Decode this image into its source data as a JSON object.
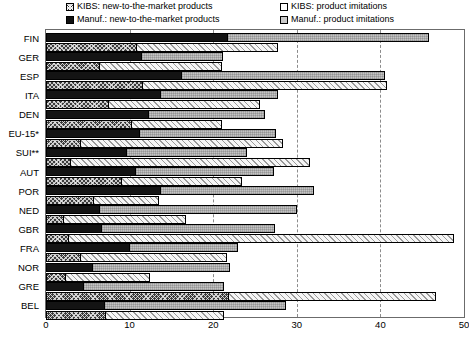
{
  "legend": {
    "items": [
      {
        "key": "kibs_new",
        "label": "KIBS: new-to-the-market products",
        "swatch": "kibs-new-swatch-icon",
        "color": "#3a3a3a"
      },
      {
        "key": "kibs_imit",
        "label": "KIBS: product imitations",
        "swatch": "kibs-imitations-swatch-icon",
        "color": "#ffffff"
      },
      {
        "key": "manuf_new",
        "label": "Manuf.: new-to-the-market products",
        "swatch": "manuf-new-swatch-icon",
        "color": "#111111"
      },
      {
        "key": "manuf_imit",
        "label": "Manuf.: product imitations",
        "swatch": "manuf-imitations-swatch-icon",
        "color": "#c9c9c9"
      }
    ]
  },
  "chart_data": {
    "type": "bar",
    "orientation": "horizontal",
    "stacked": true,
    "title": "",
    "xlabel": "",
    "ylabel": "",
    "xlim": [
      0,
      50
    ],
    "ylim": null,
    "grid": true,
    "gridlines": [
      10,
      20,
      30,
      40
    ],
    "xticks": [
      0,
      10,
      20,
      30,
      40,
      50
    ],
    "xtick_labels": [
      "0",
      "10",
      "20",
      "30",
      "40",
      "50"
    ],
    "legend_position": "top",
    "categories": [
      "FIN",
      "GER",
      "ESP",
      "ITA",
      "DEN",
      "EU-15*",
      "SUI**",
      "AUT",
      "POR",
      "NED",
      "GBR",
      "FRA",
      "NOR",
      "GRE",
      "BEL"
    ],
    "series": [
      {
        "name": "Manuf.: new-to-the-market products",
        "key": "manuf_new",
        "values": [
          21.5,
          11.2,
          16.0,
          13.5,
          12.1,
          11.0,
          9.4,
          10.5,
          13.5,
          6.2,
          6.5,
          9.8,
          5.4,
          4.3,
          6.8
        ]
      },
      {
        "name": "Manuf.: product imitations",
        "key": "manuf_imit",
        "values": [
          24.3,
          10.0,
          24.5,
          14.3,
          14.1,
          16.5,
          14.6,
          16.8,
          18.5,
          23.8,
          20.9,
          13.2,
          16.6,
          17.0,
          21.9
        ]
      },
      {
        "name": "KIBS: new-to-the-market products",
        "key": "kibs_new",
        "values": [
          10.7,
          6.2,
          11.4,
          7.3,
          10.1,
          4.0,
          2.8,
          8.9,
          5.5,
          1.9,
          2.5,
          4.0,
          2.2,
          21.6,
          6.9
        ]
      },
      {
        "name": "KIBS: product imitations",
        "key": "kibs_imit",
        "values": [
          17.0,
          14.8,
          29.4,
          18.3,
          11.0,
          24.3,
          28.8,
          14.6,
          8.0,
          14.8,
          46.3,
          17.7,
          10.2,
          25.1,
          14.4
        ]
      }
    ],
    "stack_totals": {
      "manuf": [
        45.8,
        21.2,
        40.5,
        27.8,
        26.2,
        27.5,
        24.0,
        27.3,
        32.0,
        30.0,
        27.4,
        23.0,
        22.0,
        21.3,
        28.7
      ],
      "kibs": [
        27.7,
        21.0,
        40.8,
        25.6,
        21.1,
        28.3,
        31.6,
        23.5,
        13.5,
        16.7,
        48.8,
        21.7,
        12.4,
        46.7,
        21.3
      ]
    }
  }
}
